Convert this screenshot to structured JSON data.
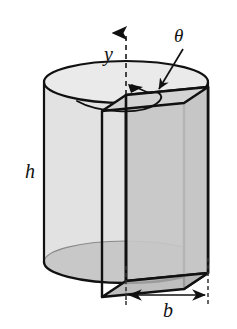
{
  "figure": {
    "type": "geometry-diagram",
    "background_color": "#ffffff",
    "stroke_color": "#111111"
  },
  "labels": {
    "axis_y": "y",
    "angle_theta": "θ",
    "height_h": "h",
    "width_b": "b"
  },
  "geometry": {
    "cylinder": {
      "name": "outer-cylinder",
      "center_x": 126,
      "left_x": 44,
      "right_x": 208,
      "radius_x": 82,
      "radius_y": 21,
      "top_center_y": 82,
      "bottom_center_y": 262,
      "body_fill": "#e2e2e2",
      "top_face_fill": "#eaeaea",
      "bottom_inner_fill": "#a9a9a9",
      "outline_width": 2.0
    },
    "plate": {
      "name": "inner-rectangular-plate",
      "front_face_fill": "#c6c6c6",
      "side_face_fill": "#c0c0c0",
      "top_face_fill": "#d2d2d2",
      "outline_width": 2.6,
      "near_top_x": 126,
      "near_top_y": 95,
      "far_top_x": 208,
      "far_top_y": 87,
      "depth_dx": -24,
      "depth_dy": 16,
      "plate_height": 186
    },
    "axis": {
      "name": "vertical-axis",
      "x": 126,
      "top_y": 29,
      "bottom_y": 300,
      "dash": "5,4",
      "arrow_at": "top"
    },
    "rotation_arrow": {
      "name": "rotation-direction-arrow",
      "description": "curved arrow indicating rotation about the y axis"
    },
    "theta_leader": {
      "name": "theta-leader-line",
      "from_x": 181,
      "from_y": 48,
      "to_x": 156,
      "to_y": 92
    },
    "dimension_b": {
      "name": "b-dimension",
      "y": 297,
      "left_x": 126,
      "right_x": 208,
      "ext_left_top_y": 268,
      "ext_right_top_y": 262
    }
  }
}
